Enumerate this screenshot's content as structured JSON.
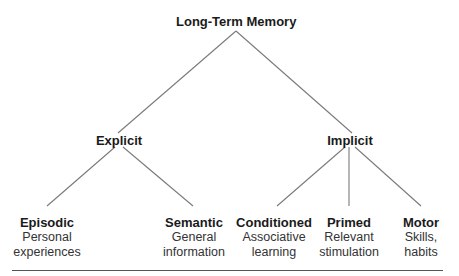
{
  "diagram": {
    "root": {
      "label": "Long-Term Memory"
    },
    "branches": [
      {
        "label": "Explicit",
        "children": [
          {
            "label": "Episodic",
            "description_lines": [
              "Personal",
              "experiences"
            ]
          },
          {
            "label": "Semantic",
            "description_lines": [
              "General",
              "information"
            ]
          }
        ]
      },
      {
        "label": "Implicit",
        "children": [
          {
            "label": "Conditioned",
            "description_lines": [
              "Associative",
              "learning"
            ]
          },
          {
            "label": "Primed",
            "description_lines": [
              "Relevant",
              "stimulation"
            ]
          },
          {
            "label": "Motor",
            "description_lines": [
              "Skills,",
              "habits"
            ]
          }
        ]
      }
    ],
    "colors": {
      "line": "#7a7a7a",
      "text": "#1a1a1a",
      "rule": "#555555"
    }
  }
}
